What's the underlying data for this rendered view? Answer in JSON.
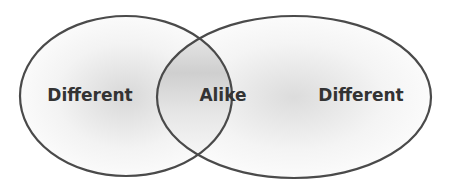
{
  "diagram": {
    "type": "venn",
    "sets": [
      {
        "id": "left",
        "label": "Different"
      },
      {
        "id": "overlap",
        "label": "Alike"
      },
      {
        "id": "right",
        "label": "Different"
      }
    ],
    "colors": {
      "stroke": "#4a4a4a",
      "fill_light": "#ffffff",
      "fill_shade": "#d9d9d9",
      "text": "#333333"
    }
  }
}
